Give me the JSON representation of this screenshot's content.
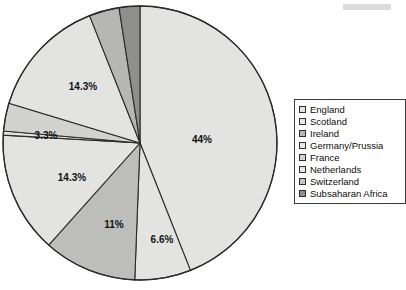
{
  "chart_data": {
    "type": "pie",
    "title": "",
    "subtitle": "",
    "xlabel": "",
    "ylabel": "",
    "grid": false,
    "legend_position": "right",
    "start_angle_deg": 0,
    "direction": "clockwise",
    "categories": [
      "England",
      "Scotland",
      "Ireland",
      "Germany/Prussia",
      "France",
      "Netherlands",
      "Switzerland",
      "Subsaharan Africa"
    ],
    "values": [
      44,
      6.6,
      11,
      14.3,
      3.3,
      3.3,
      14.3,
      3.2
    ],
    "labels": [
      "44%",
      "6.6%",
      "11%",
      "14.3%",
      "",
      "3.3%",
      "14.3%",
      ""
    ],
    "slices": [
      {
        "name": "England",
        "label": "44%",
        "value": 44,
        "color": "#e3e3e1",
        "start_deg": 0,
        "end_deg": 158.4,
        "label_x": 202,
        "label_y": 140
      },
      {
        "name": "Scotland",
        "label": "6.6%",
        "value": 6.6,
        "color": "#e3e3e1",
        "start_deg": 158.4,
        "end_deg": 182.2,
        "label_x": 162,
        "label_y": 240
      },
      {
        "name": "Ireland",
        "label": "11%",
        "value": 11,
        "color": "#bdbdbb",
        "start_deg": 182.2,
        "end_deg": 221.8,
        "label_x": 114,
        "label_y": 225
      },
      {
        "name": "Germany/Prussia",
        "label": "14.3%",
        "value": 14.3,
        "color": "#e3e3e1",
        "start_deg": 221.8,
        "end_deg": 273.3,
        "label_x": 72,
        "label_y": 178
      },
      {
        "name": "France",
        "label": "",
        "value": 3.3,
        "color": "#e3e3e1",
        "start_deg": 273.3,
        "end_deg": 275.0,
        "label_x": 0,
        "label_y": 0
      },
      {
        "name": "Netherlands",
        "label": "3.3%",
        "value": 3.3,
        "color": "#d2d2d0",
        "start_deg": 275.0,
        "end_deg": 286.9,
        "label_x": 46,
        "label_y": 136
      },
      {
        "name": "Switzerland",
        "label": "14.3%",
        "value": 14.3,
        "color": "#e3e3e1",
        "start_deg": 286.9,
        "end_deg": 338.4,
        "label_x": 83,
        "label_y": 87
      },
      {
        "name": "Switzerland-inner",
        "label": "",
        "value": 7,
        "color": "#b6b6b4",
        "start_deg": 338.4,
        "end_deg": 351.2,
        "label_x": 0,
        "label_y": 0
      },
      {
        "name": "Subsaharan Africa",
        "label": "",
        "value": 3.2,
        "color": "#8f8f8d",
        "start_deg": 351.2,
        "end_deg": 360,
        "label_x": 0,
        "label_y": 0
      }
    ],
    "geometry": {
      "cx": 140,
      "cy": 143,
      "r": 137
    },
    "stroke_color": "#2b2b2b"
  },
  "legend": {
    "items": [
      {
        "label": "England",
        "color": "#e3e3e1"
      },
      {
        "label": "Scotland",
        "color": "#e9e9e7"
      },
      {
        "label": "Ireland",
        "color": "#b6b6b4"
      },
      {
        "label": "Germany/Prussia",
        "color": "#e9e9e7"
      },
      {
        "label": "France",
        "color": "#d2d2d0"
      },
      {
        "label": "Netherlands",
        "color": "#e9e9e7"
      },
      {
        "label": "Switzerland",
        "color": "#c4c4c2"
      },
      {
        "label": "Subsaharan Africa",
        "color": "#8f8f8d"
      }
    ]
  }
}
